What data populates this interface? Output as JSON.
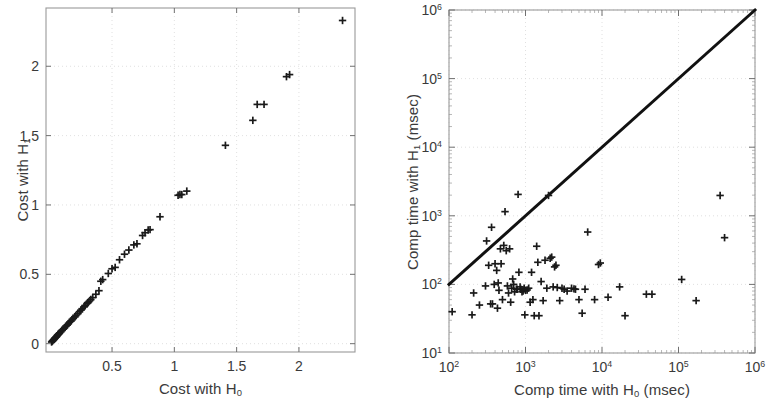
{
  "figure": {
    "background": "#ffffff",
    "marker_color": "#1a1a1a",
    "axis_color": "#9a9a9a",
    "grid_color": "#d8d8d8",
    "line_color": "#111111"
  },
  "panels": [
    {
      "id": "cost-panel",
      "name": "cost-scatter-plot",
      "xlabel_parts": {
        "pre": "Cost with H",
        "sub": "0",
        "post": ""
      },
      "ylabel_parts": {
        "pre": "Cost with H",
        "sub": "1",
        "post": ""
      },
      "xticks": [
        "0.5",
        "1",
        "1.5",
        "2"
      ],
      "xtick_values": [
        0.5,
        1,
        1.5,
        2
      ],
      "yticks": [
        "0",
        "0.5",
        "1",
        "1.5",
        "2"
      ],
      "ytick_values": [
        0,
        0.5,
        1,
        1.5,
        2
      ]
    },
    {
      "id": "time-panel",
      "name": "comp-time-scatter-plot",
      "xlabel_parts": {
        "pre": "Comp time with H",
        "sub": "0",
        "post": " (msec)"
      },
      "ylabel_parts": {
        "pre": "Comp time with H",
        "sub": "1",
        "post": " (msec)"
      },
      "xticks": [
        {
          "base": "10",
          "exp": "2"
        },
        {
          "base": "10",
          "exp": "3"
        },
        {
          "base": "10",
          "exp": "4"
        },
        {
          "base": "10",
          "exp": "5"
        },
        {
          "base": "10",
          "exp": "6"
        }
      ],
      "yticks": [
        {
          "base": "10",
          "exp": "1"
        },
        {
          "base": "10",
          "exp": "2"
        },
        {
          "base": "10",
          "exp": "3"
        },
        {
          "base": "10",
          "exp": "4"
        },
        {
          "base": "10",
          "exp": "5"
        },
        {
          "base": "10",
          "exp": "6"
        }
      ]
    }
  ],
  "chart_data": [
    {
      "type": "scatter",
      "id": "cost-scatter",
      "title": "",
      "xlabel": "Cost with H0",
      "ylabel": "Cost with H1",
      "xlim": [
        -0.03,
        2.45
      ],
      "ylim": [
        -0.06,
        2.42
      ],
      "xticks": [
        0.5,
        1,
        1.5,
        2
      ],
      "yticks": [
        0,
        0.5,
        1,
        1.5,
        2
      ],
      "grid": true,
      "marker": "plus",
      "legend": null,
      "points": [
        [
          0.015,
          0.012
        ],
        [
          0.02,
          0.018
        ],
        [
          0.025,
          0.022
        ],
        [
          0.03,
          0.028
        ],
        [
          0.035,
          0.032
        ],
        [
          0.04,
          0.038
        ],
        [
          0.045,
          0.042
        ],
        [
          0.05,
          0.048
        ],
        [
          0.055,
          0.052
        ],
        [
          0.06,
          0.058
        ],
        [
          0.065,
          0.063
        ],
        [
          0.07,
          0.068
        ],
        [
          0.075,
          0.072
        ],
        [
          0.08,
          0.078
        ],
        [
          0.09,
          0.088
        ],
        [
          0.1,
          0.097
        ],
        [
          0.11,
          0.106
        ],
        [
          0.12,
          0.116
        ],
        [
          0.13,
          0.126
        ],
        [
          0.14,
          0.134
        ],
        [
          0.15,
          0.145
        ],
        [
          0.16,
          0.155
        ],
        [
          0.17,
          0.163
        ],
        [
          0.18,
          0.174
        ],
        [
          0.19,
          0.183
        ],
        [
          0.2,
          0.193
        ],
        [
          0.21,
          0.203
        ],
        [
          0.225,
          0.216
        ],
        [
          0.24,
          0.231
        ],
        [
          0.25,
          0.242
        ],
        [
          0.26,
          0.252
        ],
        [
          0.275,
          0.265
        ],
        [
          0.285,
          0.276
        ],
        [
          0.3,
          0.29
        ],
        [
          0.305,
          0.295
        ],
        [
          0.315,
          0.304
        ],
        [
          0.33,
          0.318
        ],
        [
          0.345,
          0.332
        ],
        [
          0.37,
          0.356
        ],
        [
          0.395,
          0.382
        ],
        [
          0.41,
          0.45
        ],
        [
          0.425,
          0.462
        ],
        [
          0.47,
          0.506
        ],
        [
          0.5,
          0.54
        ],
        [
          0.525,
          0.55
        ],
        [
          0.56,
          0.605
        ],
        [
          0.6,
          0.645
        ],
        [
          0.635,
          0.675
        ],
        [
          0.675,
          0.712
        ],
        [
          0.7,
          0.72
        ],
        [
          0.745,
          0.78
        ],
        [
          0.765,
          0.8
        ],
        [
          0.79,
          0.82
        ],
        [
          0.805,
          0.822
        ],
        [
          0.885,
          0.915
        ],
        [
          1.03,
          1.07
        ],
        [
          1.045,
          1.075
        ],
        [
          1.06,
          1.075
        ],
        [
          1.1,
          1.1
        ],
        [
          1.41,
          1.43
        ],
        [
          1.63,
          1.61
        ],
        [
          1.665,
          1.725
        ],
        [
          1.72,
          1.725
        ],
        [
          1.9,
          1.925
        ],
        [
          1.925,
          1.94
        ],
        [
          2.35,
          2.33
        ]
      ]
    },
    {
      "type": "scatter",
      "id": "comp-time-scatter",
      "title": "",
      "xlabel": "Comp time with H0 (msec)",
      "ylabel": "Comp time with H1 (msec)",
      "xscale": "log",
      "yscale": "log",
      "xlim": [
        100,
        1000000
      ],
      "ylim": [
        10,
        1000000
      ],
      "grid": true,
      "marker": "plus",
      "legend": null,
      "reference_line": {
        "name": "y=x diagonal",
        "from": [
          100,
          100
        ],
        "to": [
          1000000,
          1000000
        ],
        "width": 3
      },
      "points": [
        [
          110,
          40
        ],
        [
          200,
          36
        ],
        [
          210,
          75
        ],
        [
          250,
          50
        ],
        [
          300,
          95
        ],
        [
          310,
          430
        ],
        [
          330,
          190
        ],
        [
          350,
          52
        ],
        [
          360,
          680
        ],
        [
          370,
          52
        ],
        [
          390,
          100
        ],
        [
          400,
          200
        ],
        [
          420,
          160
        ],
        [
          430,
          45
        ],
        [
          440,
          105
        ],
        [
          450,
          82
        ],
        [
          470,
          330
        ],
        [
          480,
          200
        ],
        [
          500,
          60
        ],
        [
          520,
          370
        ],
        [
          540,
          1150
        ],
        [
          560,
          310
        ],
        [
          580,
          95
        ],
        [
          600,
          75
        ],
        [
          620,
          330
        ],
        [
          640,
          55
        ],
        [
          660,
          88
        ],
        [
          680,
          120
        ],
        [
          700,
          100
        ],
        [
          720,
          78
        ],
        [
          760,
          85
        ],
        [
          780,
          85
        ],
        [
          800,
          2050
        ],
        [
          820,
          150
        ],
        [
          850,
          92
        ],
        [
          870,
          85
        ],
        [
          900,
          78
        ],
        [
          930,
          80
        ],
        [
          960,
          88
        ],
        [
          980,
          36
        ],
        [
          1000,
          82
        ],
        [
          1050,
          83
        ],
        [
          1100,
          88
        ],
        [
          1150,
          55
        ],
        [
          1200,
          150
        ],
        [
          1250,
          60
        ],
        [
          1300,
          35
        ],
        [
          1400,
          360
        ],
        [
          1450,
          210
        ],
        [
          1500,
          35
        ],
        [
          1600,
          110
        ],
        [
          1700,
          58
        ],
        [
          1800,
          225
        ],
        [
          1900,
          88
        ],
        [
          2000,
          1980
        ],
        [
          2100,
          240
        ],
        [
          2200,
          250
        ],
        [
          2300,
          92
        ],
        [
          2400,
          180
        ],
        [
          2500,
          190
        ],
        [
          2600,
          90
        ],
        [
          2800,
          58
        ],
        [
          3000,
          88
        ],
        [
          3200,
          85
        ],
        [
          3500,
          80
        ],
        [
          4000,
          88
        ],
        [
          4300,
          86
        ],
        [
          4500,
          85
        ],
        [
          5000,
          60
        ],
        [
          5500,
          38
        ],
        [
          6000,
          85
        ],
        [
          6500,
          580
        ],
        [
          8000,
          60
        ],
        [
          9000,
          195
        ],
        [
          9500,
          205
        ],
        [
          12000,
          65
        ],
        [
          17000,
          92
        ],
        [
          20000,
          35
        ],
        [
          38000,
          72
        ],
        [
          45000,
          72
        ],
        [
          110000,
          118
        ],
        [
          170000,
          58
        ],
        [
          350000,
          1980
        ],
        [
          400000,
          480
        ]
      ]
    }
  ]
}
